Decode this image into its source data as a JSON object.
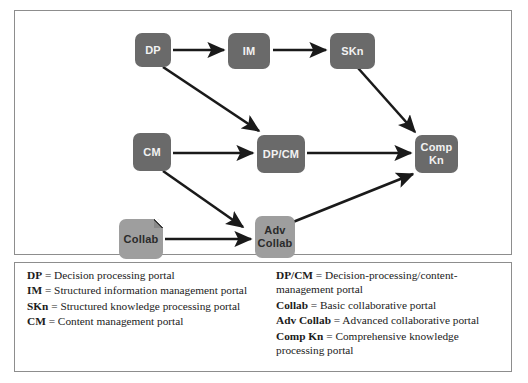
{
  "diagram": {
    "type": "flowchart",
    "nodes": [
      {
        "id": "DP",
        "label": "DP",
        "style": "dark",
        "x": 120,
        "y": 22,
        "w": 36,
        "h": 34,
        "folded": false
      },
      {
        "id": "IM",
        "label": "IM",
        "style": "dark",
        "x": 213,
        "y": 22,
        "w": 42,
        "h": 36,
        "folded": false
      },
      {
        "id": "SKn",
        "label": "SKn",
        "style": "dark",
        "x": 315,
        "y": 22,
        "w": 45,
        "h": 36,
        "folded": false
      },
      {
        "id": "CM",
        "label": "CM",
        "style": "dark",
        "x": 118,
        "y": 122,
        "w": 38,
        "h": 38,
        "folded": false
      },
      {
        "id": "DPCM",
        "label": "DP/CM",
        "style": "dark",
        "x": 242,
        "y": 124,
        "w": 48,
        "h": 38,
        "folded": false
      },
      {
        "id": "CompKn",
        "label": "Comp\nKn",
        "style": "dark",
        "x": 400,
        "y": 124,
        "w": 43,
        "h": 38,
        "folded": false
      },
      {
        "id": "Collab",
        "label": "Collab",
        "style": "light",
        "x": 104,
        "y": 208,
        "w": 44,
        "h": 40,
        "folded": true
      },
      {
        "id": "AdvCollab",
        "label": "Adv\nCollab",
        "style": "light",
        "x": 240,
        "y": 205,
        "w": 40,
        "h": 42,
        "folded": false
      }
    ],
    "edges": [
      {
        "from": "DP",
        "to": "IM",
        "x1": 158,
        "y1": 39,
        "x2": 209,
        "y2": 39
      },
      {
        "from": "IM",
        "to": "SKn",
        "x1": 258,
        "y1": 39,
        "x2": 311,
        "y2": 39
      },
      {
        "from": "DP",
        "to": "DPCM",
        "x1": 148,
        "y1": 56,
        "x2": 244,
        "y2": 120
      },
      {
        "from": "SKn",
        "to": "CompKn",
        "x1": 343,
        "y1": 57,
        "x2": 400,
        "y2": 121
      },
      {
        "from": "CM",
        "to": "DPCM",
        "x1": 158,
        "y1": 142,
        "x2": 238,
        "y2": 142
      },
      {
        "from": "DPCM",
        "to": "CompKn",
        "x1": 292,
        "y1": 142,
        "x2": 396,
        "y2": 142
      },
      {
        "from": "CM",
        "to": "AdvCollab",
        "x1": 148,
        "y1": 160,
        "x2": 228,
        "y2": 216
      },
      {
        "from": "Collab",
        "to": "AdvCollab",
        "x1": 150,
        "y1": 228,
        "x2": 236,
        "y2": 228
      },
      {
        "from": "AdvCollab",
        "to": "CompKn",
        "x1": 278,
        "y1": 211,
        "x2": 398,
        "y2": 163
      }
    ],
    "colors": {
      "node_dark": "#6a6a6a",
      "node_dark_text": "#f2f2f2",
      "node_light": "#9e9e9e",
      "node_light_text": "#2b2b2b",
      "edge": "#1a1a1a",
      "frame_border": "#8d8d8d",
      "background": "#ffffff"
    }
  },
  "legend": {
    "left": [
      {
        "term": "DP",
        "eq": " = ",
        "definition": "Decision processing portal"
      },
      {
        "term": "IM",
        "eq": " = ",
        "definition": "Structured information management portal"
      },
      {
        "term": "SKn",
        "eq": " = ",
        "definition": "Structured knowledge processing portal"
      },
      {
        "term": "CM",
        "eq": " = ",
        "definition": "Content management portal"
      }
    ],
    "right": [
      {
        "term": "DP/CM",
        "eq": " = ",
        "definition": "Decision-processing/content-management portal"
      },
      {
        "term": "Collab",
        "eq": " = ",
        "definition": "Basic collaborative portal"
      },
      {
        "term": "Adv Collab",
        "eq": " = ",
        "definition": "Advanced collaborative portal"
      },
      {
        "term": "Comp Kn",
        "eq": " = ",
        "definition": "Comprehensive knowledge processing portal"
      }
    ]
  }
}
